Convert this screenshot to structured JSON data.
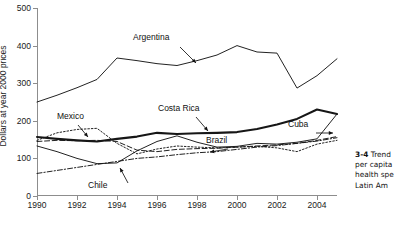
{
  "chart_data": {
    "type": "line",
    "title": "",
    "xlabel": "",
    "ylabel": "Dollars at year 2000 prices",
    "xlim": [
      1990,
      2005
    ],
    "ylim": [
      0,
      500
    ],
    "yticks": [
      0,
      100,
      200,
      300,
      400,
      500
    ],
    "xticks": [
      1990,
      1992,
      1994,
      1996,
      1998,
      2000,
      2002,
      2004
    ],
    "grid": false,
    "legend_position": "inline-annotations",
    "x": [
      1990,
      1991,
      1992,
      1993,
      1994,
      1995,
      1996,
      1997,
      1998,
      1999,
      2000,
      2001,
      2002,
      2003,
      2004,
      2005
    ],
    "series": [
      {
        "name": "Argentina",
        "style": "solid",
        "width": "thin",
        "values": [
          250,
          268,
          288,
          310,
          367,
          360,
          352,
          347,
          360,
          375,
          400,
          383,
          380,
          287,
          320,
          365
        ]
      },
      {
        "name": "Costa Rica",
        "style": "solid",
        "width": "thick",
        "values": [
          157,
          152,
          148,
          145,
          152,
          158,
          168,
          165,
          167,
          168,
          170,
          178,
          190,
          205,
          230,
          218
        ]
      },
      {
        "name": "Mexico",
        "style": "dotted",
        "width": "thin",
        "values": [
          148,
          168,
          177,
          180,
          140,
          112,
          125,
          133,
          130,
          128,
          130,
          132,
          128,
          118,
          138,
          148
        ]
      },
      {
        "name": "Brazil",
        "style": "dashed",
        "width": "thin",
        "values": [
          145,
          148,
          147,
          148,
          145,
          122,
          118,
          124,
          126,
          127,
          130,
          133,
          136,
          140,
          148,
          158
        ]
      },
      {
        "name": "Cuba",
        "style": "solid",
        "width": "thin",
        "values": [
          133,
          118,
          100,
          86,
          88,
          120,
          145,
          160,
          143,
          130,
          132,
          140,
          138,
          143,
          152,
          218
        ]
      },
      {
        "name": "Chile",
        "style": "dashdot",
        "width": "thin",
        "values": [
          60,
          68,
          76,
          84,
          92,
          100,
          104,
          110,
          115,
          118,
          124,
          130,
          134,
          140,
          146,
          155
        ]
      }
    ],
    "annotations": [
      {
        "label": "Argentina",
        "name": "argentina"
      },
      {
        "label": "Costa Rica",
        "name": "costa-rica"
      },
      {
        "label": "Mexico",
        "name": "mexico"
      },
      {
        "label": "Brazil",
        "name": "brazil"
      },
      {
        "label": "Cuba",
        "name": "cuba"
      },
      {
        "label": "Chile",
        "name": "chile"
      }
    ]
  },
  "caption": {
    "number": "3-4",
    "lines": [
      "Trend",
      "per capita",
      "health spe",
      "Latin Am"
    ]
  }
}
